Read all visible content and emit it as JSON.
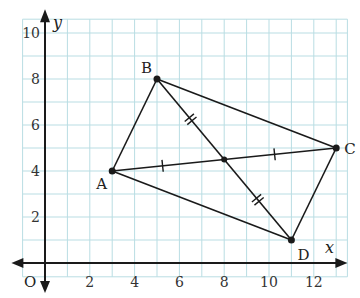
{
  "diagram": {
    "axes": {
      "x_label": "x",
      "y_label": "y",
      "origin_label": "O",
      "x_ticks": [
        "2",
        "4",
        "6",
        "8",
        "10",
        "12"
      ],
      "x_tick_values": [
        2,
        4,
        6,
        8,
        10,
        12
      ],
      "y_ticks": [
        "2",
        "4",
        "6",
        "8",
        "10"
      ],
      "y_tick_values": [
        2,
        4,
        6,
        8,
        10
      ],
      "x_range": [
        -1,
        13.5
      ],
      "y_range": [
        -0.6,
        10.6
      ]
    },
    "points": [
      {
        "name": "A",
        "x": 3,
        "y": 4
      },
      {
        "name": "B",
        "x": 5,
        "y": 8
      },
      {
        "name": "C",
        "x": 13,
        "y": 5
      },
      {
        "name": "D",
        "x": 11,
        "y": 1
      }
    ],
    "intersection": {
      "x": 8,
      "y": 4.5
    },
    "segments": [
      [
        "A",
        "B"
      ],
      [
        "B",
        "C"
      ],
      [
        "C",
        "D"
      ],
      [
        "D",
        "A"
      ],
      [
        "A",
        "C"
      ],
      [
        "B",
        "D"
      ]
    ],
    "colors": {
      "grid": "#b9dde3",
      "line": "#1a1a1a"
    }
  }
}
